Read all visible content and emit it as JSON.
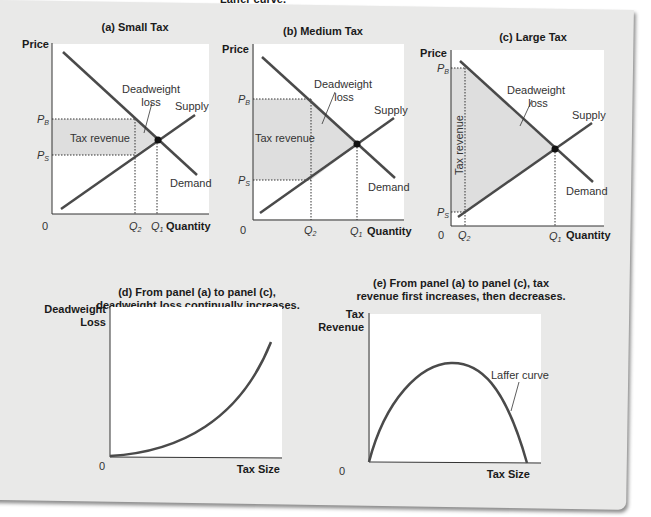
{
  "colors": {
    "background": "#e9e9e8",
    "plot_area": "#ffffff",
    "curve": "#4a4a4a",
    "shaded": "#dedede",
    "text": "#1a1a1a"
  },
  "top_clipped_text": "Laffer curve.",
  "panels": {
    "a": {
      "title": "(a) Small Tax",
      "y_axis": "Price",
      "x_axis": "Quantity",
      "origin": "0",
      "pb": "P",
      "pb_sub": "B",
      "ps": "P",
      "ps_sub": "S",
      "q2": "Q",
      "q2_sub": "2",
      "q1": "Q",
      "q1_sub": "1",
      "dwl_line1": "Deadweight",
      "dwl_line2": "loss",
      "tax_revenue": "Tax revenue",
      "supply": "Supply",
      "demand": "Demand"
    },
    "b": {
      "title": "(b) Medium Tax",
      "y_axis": "Price",
      "x_axis": "Quantity",
      "origin": "0",
      "pb": "P",
      "pb_sub": "B",
      "ps": "P",
      "ps_sub": "S",
      "q2": "Q",
      "q2_sub": "2",
      "q1": "Q",
      "q1_sub": "1",
      "dwl_line1": "Deadweight",
      "dwl_line2": "loss",
      "tax_revenue": "Tax revenue",
      "supply": "Supply",
      "demand": "Demand"
    },
    "c": {
      "title": "(c) Large Tax",
      "y_axis": "Price",
      "x_axis": "Quantity",
      "origin": "0",
      "pb": "P",
      "pb_sub": "B",
      "ps": "P",
      "ps_sub": "S",
      "q2": "Q",
      "q2_sub": "2",
      "q1": "Q",
      "q1_sub": "1",
      "dwl_line1": "Deadweight",
      "dwl_line2": "loss",
      "tax_revenue": "Tax revenue",
      "supply": "Supply",
      "demand": "Demand"
    },
    "d": {
      "title_line1": "(d) From panel (a) to panel (c),",
      "title_line2": "deadweight loss continually increases.",
      "y_axis_line1": "Deadweight",
      "y_axis_line2": "Loss",
      "x_axis": "Tax Size",
      "origin": "0"
    },
    "e": {
      "title_line1": "(e) From panel (a) to panel (c), tax",
      "title_line2": "revenue first increases, then decreases.",
      "y_axis_line1": "Tax",
      "y_axis_line2": "Revenue",
      "x_axis": "Tax Size",
      "origin": "0",
      "curve_label": "Laffer curve"
    }
  }
}
